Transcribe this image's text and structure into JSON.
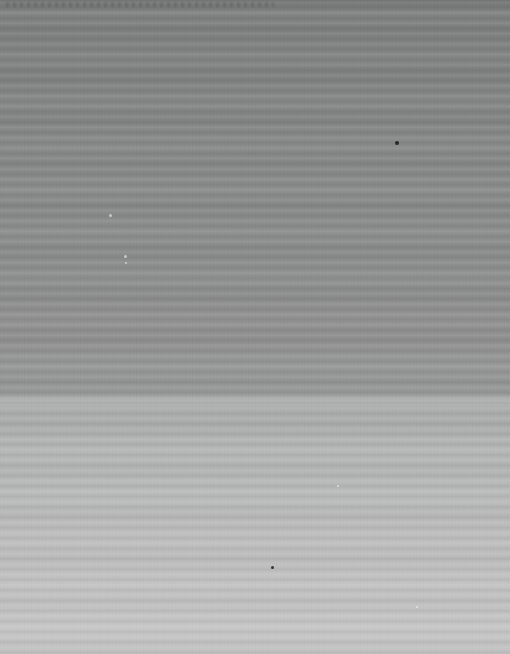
{
  "image": {
    "kind": "degraded-scan",
    "description": "Severely degraded grayscale scan consisting of horizontal scanline striping over a vertical brightness gradient. No legible text, UI chrome, or graphics.",
    "width": 510,
    "height": 654,
    "legible_text": "",
    "orientation": "portrait"
  },
  "stripes": {
    "direction": "horizontal",
    "period_px": 10.4,
    "full_bleed": true,
    "secondary_beat_period_px": 44
  },
  "bands": [
    {
      "name": "top-dark-band",
      "y_start": 0,
      "y_end": 160,
      "color": "#7f8080",
      "label": "darkest upper region"
    },
    {
      "name": "upper-mid-band",
      "y_start": 160,
      "y_end": 250,
      "color": "#878888",
      "label": "upper middle"
    },
    {
      "name": "mid-band",
      "y_start": 250,
      "y_end": 330,
      "color": "#8b8c8c",
      "label": "middle"
    },
    {
      "name": "pre-step-band",
      "y_start": 330,
      "y_end": 398,
      "color": "#949595",
      "label": "gradual brightening"
    },
    {
      "name": "lower-light-band",
      "y_start": 404,
      "y_end": 530,
      "color": "#b5b6b6",
      "label": "light lower region"
    },
    {
      "name": "bottom-band",
      "y_start": 530,
      "y_end": 654,
      "color": "#c4c4c4",
      "label": "lightest bottom region"
    }
  ],
  "transition": {
    "name": "brightness-step",
    "y": 400,
    "from_color": "#989999",
    "to_color": "#a9aaaa",
    "note": "abrupt luminance step from darker upper half to lighter lower half"
  },
  "artifacts": [
    {
      "name": "dark-speck",
      "x": 397,
      "y": 143,
      "size": 4,
      "tone": "dark"
    },
    {
      "name": "light-speck",
      "x": 110,
      "y": 215,
      "size": 3,
      "tone": "light"
    },
    {
      "name": "light-speck",
      "x": 125,
      "y": 256,
      "size": 3,
      "tone": "light"
    },
    {
      "name": "light-speck",
      "x": 126,
      "y": 263,
      "size": 2,
      "tone": "light"
    },
    {
      "name": "dark-speck",
      "x": 272,
      "y": 567,
      "size": 3,
      "tone": "dark"
    },
    {
      "name": "light-speck",
      "x": 338,
      "y": 486,
      "size": 2,
      "tone": "light"
    },
    {
      "name": "light-speck",
      "x": 417,
      "y": 607,
      "size": 2,
      "tone": "light"
    }
  ],
  "palette": {
    "darkest": "#7d7e7e",
    "mid": "#8b8c8c",
    "light": "#b5b6b6",
    "lightest": "#c6c6c6"
  }
}
